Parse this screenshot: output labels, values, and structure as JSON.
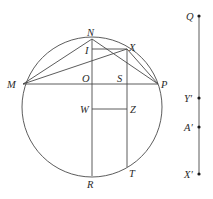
{
  "figure": {
    "circle": {
      "cx": 92,
      "cy": 107,
      "r": 70
    },
    "points": {
      "N": {
        "x": 92,
        "y": 39,
        "label": "N",
        "lx": 87,
        "ly": 36
      },
      "M": {
        "x": 23,
        "y": 84,
        "label": "M",
        "lx": 7,
        "ly": 88
      },
      "P": {
        "x": 158,
        "y": 84,
        "label": "P",
        "lx": 161,
        "ly": 88
      },
      "O": {
        "x": 92,
        "y": 84,
        "label": "O",
        "lx": 82,
        "ly": 82
      },
      "X": {
        "x": 127,
        "y": 49,
        "label": "X",
        "lx": 129,
        "ly": 51
      },
      "I": {
        "x": 92,
        "y": 49,
        "label": "I",
        "lx": 85,
        "ly": 54
      },
      "S": {
        "x": 127,
        "y": 84,
        "label": "S",
        "lx": 117,
        "ly": 82
      },
      "W": {
        "x": 92,
        "y": 109,
        "label": "W",
        "lx": 80,
        "ly": 113
      },
      "Z": {
        "x": 127,
        "y": 109,
        "label": "Z",
        "lx": 130,
        "ly": 113
      },
      "R": {
        "x": 92,
        "y": 176,
        "label": "R",
        "lx": 87,
        "ly": 188
      },
      "T": {
        "x": 127,
        "y": 167,
        "label": "T",
        "lx": 129,
        "ly": 177
      }
    },
    "segments": [
      [
        "M",
        "P"
      ],
      [
        "M",
        "N"
      ],
      [
        "M",
        "X"
      ],
      [
        "N",
        "P"
      ],
      [
        "X",
        "P"
      ],
      [
        "N",
        "R"
      ],
      [
        "I",
        "X"
      ],
      [
        "X",
        "T"
      ],
      [
        "W",
        "Z"
      ]
    ],
    "number_line": {
      "x": 199,
      "y_top": 16,
      "y_bottom": 174,
      "points": [
        {
          "label": "Q",
          "y": 16,
          "lx": 186,
          "ly": 20
        },
        {
          "label": "Y′",
          "y": 98,
          "lx": 184,
          "ly": 102
        },
        {
          "label": "A′",
          "y": 127,
          "lx": 184,
          "ly": 131
        },
        {
          "label": "X′",
          "y": 174,
          "lx": 184,
          "ly": 178
        }
      ]
    }
  }
}
